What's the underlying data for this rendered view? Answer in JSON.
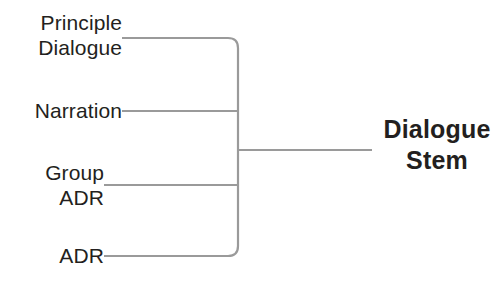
{
  "diagram": {
    "line_color": "#9a9a9a",
    "text_color": "#231f20",
    "background_color": "#ffffff",
    "inputs": [
      {
        "id": "principle-dialogue",
        "label": "Principle\nDialogue"
      },
      {
        "id": "narration",
        "label": "Narration"
      },
      {
        "id": "group-adr",
        "label": "Group\nADR"
      },
      {
        "id": "adr",
        "label": "ADR"
      }
    ],
    "output": {
      "id": "dialogue-stem",
      "label": "Dialogue\nStem"
    }
  }
}
